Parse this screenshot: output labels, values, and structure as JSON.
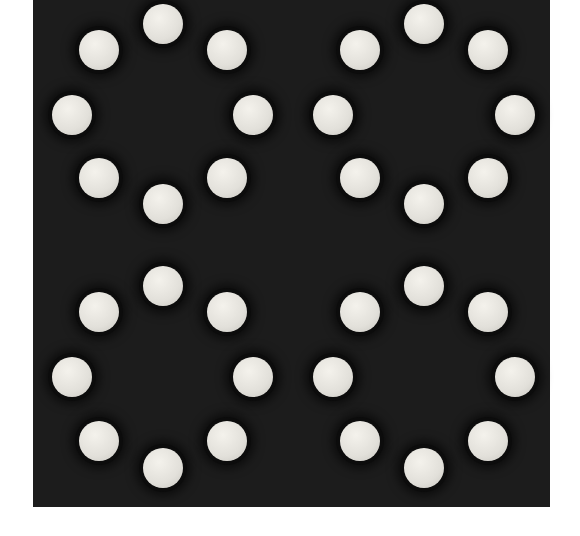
{
  "scene": {
    "description": "Dark square panel with 32 white circular holes arranged in four rings of eight",
    "panel_color": "#1c1c1c",
    "hole_color": "#e8e6e0",
    "hole_radius": 20,
    "rings": [
      {
        "name": "top-left",
        "holes": [
          [
            163,
            24
          ],
          [
            99,
            50
          ],
          [
            227,
            50
          ],
          [
            72,
            115
          ],
          [
            253,
            115
          ],
          [
            99,
            178
          ],
          [
            227,
            178
          ],
          [
            163,
            204
          ]
        ]
      },
      {
        "name": "top-right",
        "holes": [
          [
            424,
            24
          ],
          [
            360,
            50
          ],
          [
            488,
            50
          ],
          [
            333,
            115
          ],
          [
            515,
            115
          ],
          [
            360,
            178
          ],
          [
            488,
            178
          ],
          [
            424,
            204
          ]
        ]
      },
      {
        "name": "bottom-left",
        "holes": [
          [
            163,
            286
          ],
          [
            99,
            312
          ],
          [
            227,
            312
          ],
          [
            72,
            377
          ],
          [
            253,
            377
          ],
          [
            99,
            441
          ],
          [
            227,
            441
          ],
          [
            163,
            468
          ]
        ]
      },
      {
        "name": "bottom-right",
        "holes": [
          [
            424,
            286
          ],
          [
            360,
            312
          ],
          [
            488,
            312
          ],
          [
            333,
            377
          ],
          [
            515,
            377
          ],
          [
            360,
            441
          ],
          [
            488,
            441
          ],
          [
            424,
            468
          ]
        ]
      }
    ]
  }
}
